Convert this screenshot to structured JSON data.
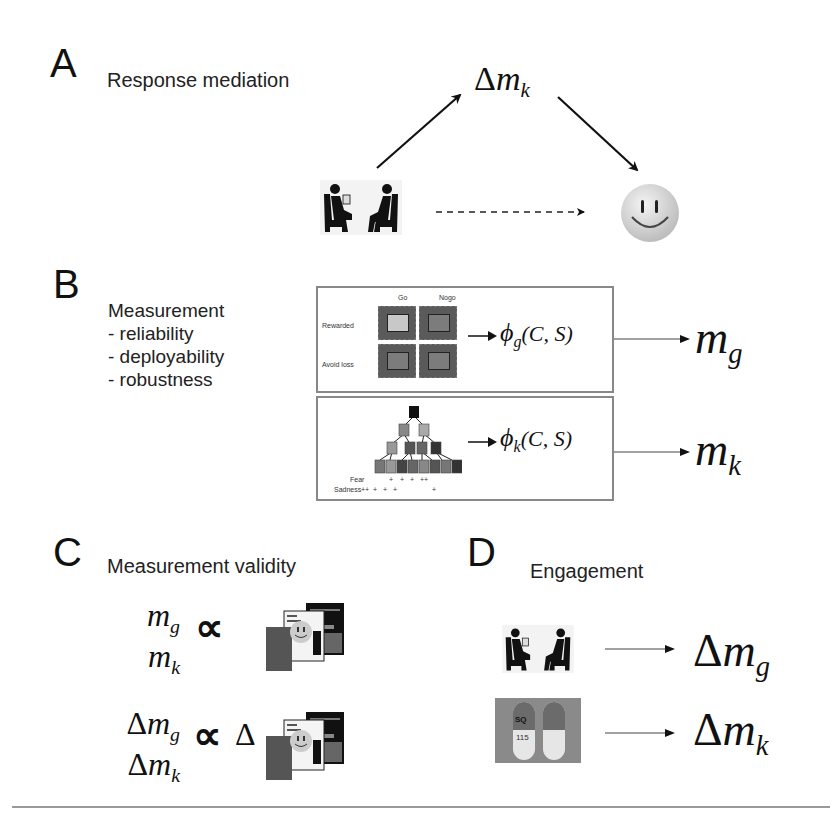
{
  "panels": {
    "A": {
      "letter": "A",
      "title": "Response mediation",
      "mediator": {
        "delta": "Δ",
        "var": "m",
        "sub": "k"
      },
      "icons": {
        "source": "therapy-session-icon",
        "outcome": "smiley-face-icon"
      }
    },
    "B": {
      "letter": "B",
      "list_title": "Measurement",
      "list_items": [
        "- reliability",
        "- deployability",
        "- robustness"
      ],
      "task_g": {
        "col_headers": [
          "Go",
          "Nogo"
        ],
        "row_labels": [
          "Rewarded",
          "Avoid loss"
        ],
        "function": {
          "phi": "ϕ",
          "sub": "g",
          "args": "(C, S)"
        },
        "output": {
          "var": "m",
          "sub": "g"
        }
      },
      "task_k": {
        "row_labels": [
          "Fear",
          "Sadness"
        ],
        "fear_marks": [
          "+",
          "+",
          "+",
          "++"
        ],
        "sadness_marks": [
          "++",
          "+",
          "+",
          "+",
          "+"
        ],
        "function": {
          "phi": "ϕ",
          "sub": "k",
          "args": "(C, S)"
        },
        "output": {
          "var": "m",
          "sub": "k"
        }
      }
    },
    "C": {
      "letter": "C",
      "title": "Measurement validity",
      "row1": {
        "top": {
          "var": "m",
          "sub": "g"
        },
        "bottom": {
          "var": "m",
          "sub": "k"
        },
        "relation": "∝"
      },
      "row2": {
        "top": {
          "delta": "Δ",
          "var": "m",
          "sub": "g"
        },
        "bottom": {
          "delta": "Δ",
          "var": "m",
          "sub": "k"
        },
        "relation": "∝",
        "prefix": "Δ"
      },
      "icons": {
        "questionnaires": "clinical-questionnaires-icon"
      }
    },
    "D": {
      "letter": "D",
      "title": "Engagement",
      "row1": {
        "icon": "therapy-session-icon",
        "output": {
          "delta": "Δ",
          "var": "m",
          "sub": "g"
        }
      },
      "row2": {
        "icon": "capsules-icon",
        "pill_text_top": "SQ",
        "pill_text_bottom": "115",
        "output": {
          "delta": "Δ",
          "var": "m",
          "sub": "k"
        }
      }
    }
  },
  "colors": {
    "box_border": "#888888",
    "cell_dark": "#5a5a5a",
    "cell_light": "#c8c8c8",
    "text": "#111111"
  }
}
